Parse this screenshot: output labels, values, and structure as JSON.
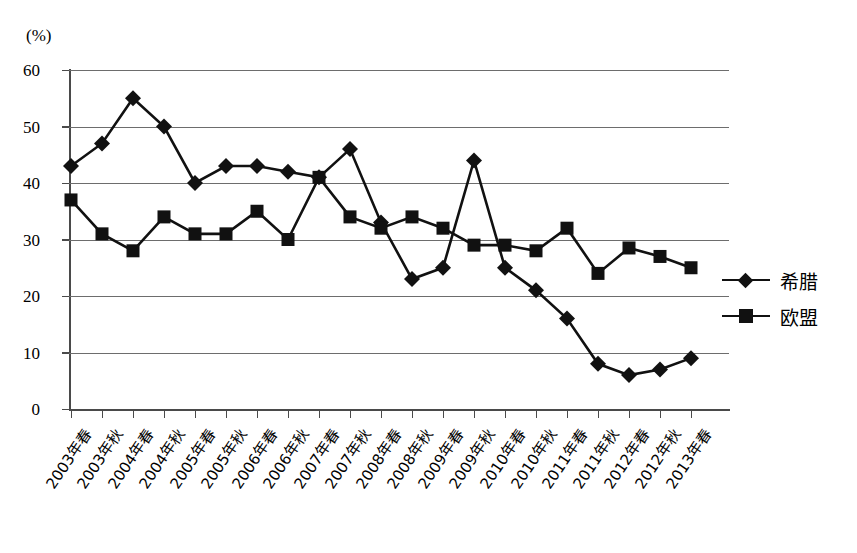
{
  "chart_data": {
    "type": "line",
    "title": "",
    "subtitle": "",
    "xlabel": "",
    "ylabel": "(%)",
    "unit_label": "(%)",
    "ylim": [
      0,
      60
    ],
    "ytick_step": 10,
    "yticks": [
      "0",
      "10",
      "20",
      "30",
      "40",
      "50",
      "60"
    ],
    "grid": true,
    "legend_position": "right",
    "categories": [
      "2003年春",
      "2003年秋",
      "2004年春",
      "2004年秋",
      "2005年春",
      "2005年秋",
      "2006年春",
      "2006年秋",
      "2007年春",
      "2007年秋",
      "2008年春",
      "2008年秋",
      "2009年春",
      "2009年秋",
      "2010年春",
      "2010年秋",
      "2011年春",
      "2011年秋",
      "2012年春",
      "2012年秋",
      "2013年春"
    ],
    "series": [
      {
        "name": "希腊",
        "marker": "diamond",
        "color": "#111111",
        "values": [
          43,
          47,
          55,
          50,
          40,
          43,
          43,
          42,
          41,
          46,
          33,
          23,
          25,
          44,
          25,
          21,
          16,
          8,
          6,
          7,
          9
        ]
      },
      {
        "name": "欧盟",
        "marker": "square",
        "color": "#111111",
        "values": [
          37,
          31,
          28,
          34,
          31,
          31,
          35,
          30,
          41,
          34,
          32,
          34,
          32,
          29,
          29,
          28,
          32,
          24,
          28.5,
          27,
          25
        ]
      }
    ]
  },
  "legend": {
    "items": [
      {
        "label": "希腊",
        "marker": "diamond"
      },
      {
        "label": "欧盟",
        "marker": "square"
      }
    ]
  }
}
